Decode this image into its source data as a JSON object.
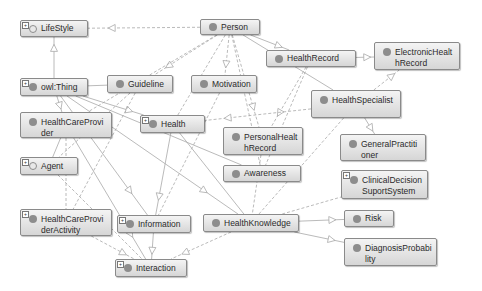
{
  "diagram": {
    "type": "ontology-class-graph",
    "nodes": [
      {
        "id": "lifestyle",
        "label": "LifeStyle",
        "x": 20,
        "y": 20,
        "w": 68,
        "h": 17,
        "expand": true,
        "hollow": true
      },
      {
        "id": "person",
        "label": "Person",
        "x": 200,
        "y": 19,
        "w": 60,
        "h": 16,
        "expand": false,
        "hollow": false
      },
      {
        "id": "electronichealthrecord",
        "label": "ElectronicHealthRecord",
        "x": 374,
        "y": 42,
        "w": 86,
        "h": 28,
        "expand": false,
        "hollow": false
      },
      {
        "id": "healthrecord",
        "label": "HealthRecord",
        "x": 266,
        "y": 50,
        "w": 90,
        "h": 17,
        "expand": false,
        "hollow": false
      },
      {
        "id": "owlthing",
        "label": "owl:Thing",
        "x": 20,
        "y": 78,
        "w": 68,
        "h": 18,
        "expand": true,
        "hollow": false
      },
      {
        "id": "guideline",
        "label": "Guideline",
        "x": 107,
        "y": 75,
        "w": 66,
        "h": 18,
        "expand": false,
        "hollow": false
      },
      {
        "id": "motivation",
        "label": "Motivation",
        "x": 191,
        "y": 75,
        "w": 66,
        "h": 18,
        "expand": false,
        "hollow": false
      },
      {
        "id": "healthspecialist",
        "label": "HealthSpecialist",
        "x": 311,
        "y": 90,
        "w": 90,
        "h": 28,
        "expand": false,
        "hollow": false
      },
      {
        "id": "healthcareprovider",
        "label": "HealthCareProvider",
        "x": 20,
        "y": 112,
        "w": 92,
        "h": 26,
        "expand": false,
        "hollow": false
      },
      {
        "id": "health",
        "label": "Health",
        "x": 140,
        "y": 115,
        "w": 65,
        "h": 18,
        "expand": true,
        "hollow": false
      },
      {
        "id": "personalhealthrecord",
        "label": "PersonalHealthRecord",
        "x": 223,
        "y": 127,
        "w": 80,
        "h": 28,
        "expand": false,
        "hollow": false
      },
      {
        "id": "generalpractitioner",
        "label": "GeneralPractitioner",
        "x": 340,
        "y": 134,
        "w": 86,
        "h": 27,
        "expand": false,
        "hollow": false
      },
      {
        "id": "agent",
        "label": "Agent",
        "x": 20,
        "y": 157,
        "w": 58,
        "h": 18,
        "expand": true,
        "hollow": true
      },
      {
        "id": "awareness",
        "label": "Awareness",
        "x": 223,
        "y": 165,
        "w": 78,
        "h": 17,
        "expand": false,
        "hollow": false
      },
      {
        "id": "clinicaldecisionsupportsystem",
        "label": "ClinicalDecisionSuportSystem",
        "x": 341,
        "y": 170,
        "w": 87,
        "h": 29,
        "expand": true,
        "hollow": false
      },
      {
        "id": "healthcareprovideractivity",
        "label": "HealthCareProviderActivity",
        "x": 20,
        "y": 209,
        "w": 92,
        "h": 27,
        "expand": true,
        "hollow": false
      },
      {
        "id": "information",
        "label": "Information",
        "x": 117,
        "y": 215,
        "w": 74,
        "h": 18,
        "expand": true,
        "hollow": false
      },
      {
        "id": "healthknowledge",
        "label": "HealthKnowledge",
        "x": 203,
        "y": 214,
        "w": 96,
        "h": 18,
        "expand": false,
        "hollow": false
      },
      {
        "id": "risk",
        "label": "Risk",
        "x": 344,
        "y": 210,
        "w": 50,
        "h": 17,
        "expand": false,
        "hollow": false
      },
      {
        "id": "diagnosisprobability",
        "label": "DiagnosisProbability",
        "x": 344,
        "y": 238,
        "w": 93,
        "h": 28,
        "expand": false,
        "hollow": false
      },
      {
        "id": "interaction",
        "label": "Interaction",
        "x": 115,
        "y": 259,
        "w": 72,
        "h": 18,
        "expand": true,
        "hollow": false
      }
    ],
    "edges": [
      {
        "from": "owlthing",
        "to": "lifestyle",
        "style": "solid",
        "arrow": true
      },
      {
        "from": "person",
        "to": "lifestyle",
        "style": "dashed",
        "arrow": true
      },
      {
        "from": "person",
        "to": "healthrecord",
        "style": "solid",
        "arrow": true
      },
      {
        "from": "healthrecord",
        "to": "electronichealthrecord",
        "style": "solid",
        "arrow": true
      },
      {
        "from": "healthspecialist",
        "to": "electronichealthrecord",
        "style": "dashed",
        "arrow": true
      },
      {
        "from": "person",
        "to": "guideline",
        "style": "dashed",
        "arrow": true
      },
      {
        "from": "person",
        "to": "motivation",
        "style": "dashed",
        "arrow": true
      },
      {
        "from": "person",
        "to": "health",
        "style": "dashed",
        "arrow": false
      },
      {
        "from": "person",
        "to": "healthspecialist",
        "style": "solid",
        "arrow": false
      },
      {
        "from": "person",
        "to": "personalhealthrecord",
        "style": "dashed",
        "arrow": true
      },
      {
        "from": "person",
        "to": "healthcareprovider",
        "style": "dashed",
        "arrow": false
      },
      {
        "from": "person",
        "to": "awareness",
        "style": "dashed",
        "arrow": true
      },
      {
        "from": "healthrecord",
        "to": "personalhealthrecord",
        "style": "dashed",
        "arrow": true
      },
      {
        "from": "healthrecord",
        "to": "awareness",
        "style": "dashed",
        "arrow": true
      },
      {
        "from": "owlthing",
        "to": "guideline",
        "style": "solid",
        "arrow": false
      },
      {
        "from": "owlthing",
        "to": "health",
        "style": "solid",
        "arrow": true
      },
      {
        "from": "owlthing",
        "to": "healthcareprovider",
        "style": "solid",
        "arrow": true
      },
      {
        "from": "owlthing",
        "to": "awareness",
        "style": "solid",
        "arrow": false
      },
      {
        "from": "owlthing",
        "to": "healthknowledge",
        "style": "solid",
        "arrow": true
      },
      {
        "from": "owlthing",
        "to": "information",
        "style": "solid",
        "arrow": true
      },
      {
        "from": "healthspecialist",
        "to": "health",
        "style": "dashed",
        "arrow": true
      },
      {
        "from": "healthspecialist",
        "to": "generalpractitioner",
        "style": "solid",
        "arrow": true
      },
      {
        "from": "healthspecialist",
        "to": "healthknowledge",
        "style": "dashed",
        "arrow": false
      },
      {
        "from": "guideline",
        "to": "healthcareprovideractivity",
        "style": "dashed",
        "arrow": false
      },
      {
        "from": "guideline",
        "to": "agent",
        "style": "dashed",
        "arrow": false
      },
      {
        "from": "healthcareprovider",
        "to": "agent",
        "style": "solid",
        "arrow": false
      },
      {
        "from": "healthcareprovider",
        "to": "healthcareprovideractivity",
        "style": "dashed",
        "arrow": false
      },
      {
        "from": "healthcareprovider",
        "to": "interaction",
        "style": "solid",
        "arrow": true
      },
      {
        "from": "health",
        "to": "information",
        "style": "solid",
        "arrow": true
      },
      {
        "from": "health",
        "to": "healthknowledge",
        "style": "solid",
        "arrow": false
      },
      {
        "from": "motivation",
        "to": "information",
        "style": "dashed",
        "arrow": false
      },
      {
        "from": "personalhealthrecord",
        "to": "healthknowledge",
        "style": "dashed",
        "arrow": false
      },
      {
        "from": "healthknowledge",
        "to": "clinicaldecisionsupportsystem",
        "style": "dashed",
        "arrow": false
      },
      {
        "from": "healthknowledge",
        "to": "risk",
        "style": "solid",
        "arrow": true
      },
      {
        "from": "healthknowledge",
        "to": "diagnosisprobability",
        "style": "solid",
        "arrow": true
      },
      {
        "from": "healthknowledge",
        "to": "interaction",
        "style": "dashed",
        "arrow": true
      },
      {
        "from": "information",
        "to": "interaction",
        "style": "solid",
        "arrow": true
      },
      {
        "from": "agent",
        "to": "interaction",
        "style": "dashed",
        "arrow": false
      },
      {
        "from": "healthcareprovideractivity",
        "to": "interaction",
        "style": "dashed",
        "arrow": true
      }
    ]
  },
  "colors": {
    "node_border": "#8a8a8a",
    "node_fill_top": "#f4f4f4",
    "node_fill_bottom": "#d6d6d6",
    "dot": "#8d8d8d",
    "edge": "#a8a8a8",
    "text": "#2a2a2a"
  }
}
